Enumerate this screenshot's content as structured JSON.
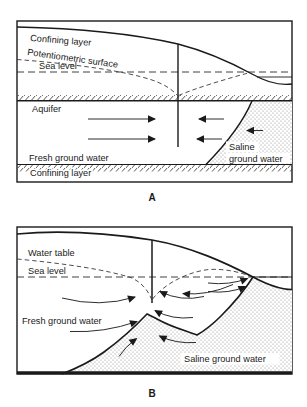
{
  "figure": {
    "panel_a": {
      "tag": "A",
      "confining_top": "Confining layer",
      "potentiometric": "Potentiometric surface",
      "sea_level": "Sea level",
      "aquifer": "Aquifer",
      "fresh": "Fresh ground water",
      "saline_line1": "Saline",
      "saline_line2": "ground water",
      "confining_bottom": "Confining layer"
    },
    "panel_b": {
      "tag": "B",
      "water_table": "Water table",
      "sea_level": "Sea level",
      "fresh": "Fresh ground water",
      "saline": "Saline ground water"
    },
    "colors": {
      "ink": "#1a1a1a",
      "paper": "#ffffff"
    }
  }
}
